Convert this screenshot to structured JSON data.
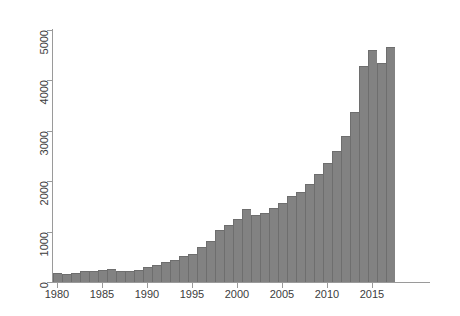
{
  "chart_data": {
    "type": "bar",
    "title": "",
    "subtitle": "",
    "xlabel": "",
    "ylabel": "",
    "xlim": [
      1979.5,
      2017.5
    ],
    "ylim": [
      0,
      5200
    ],
    "grid": false,
    "legend": null,
    "bar_color": "#828282",
    "bar_edge_color": "#6e6e6e",
    "axis_color": "#9a9a9a",
    "text_color": "#3c3c3c",
    "background": "#ffffff",
    "y_ticks": [
      0,
      1000,
      2000,
      3000,
      4000,
      5000
    ],
    "y_tick_labels": [
      "0",
      "1000",
      "2000",
      "3000",
      "4000",
      "5000"
    ],
    "x_ticks": [
      1980,
      1985,
      1990,
      1995,
      2000,
      2005,
      2010,
      2015
    ],
    "x_tick_labels": [
      "1980",
      "1985",
      "1990",
      "1995",
      "2000",
      "2005",
      "2010",
      "2015"
    ],
    "categories": [
      "1980",
      "1981",
      "1982",
      "1983",
      "1984",
      "1985",
      "1986",
      "1987",
      "1988",
      "1989",
      "1990",
      "1991",
      "1992",
      "1993",
      "1994",
      "1995",
      "1996",
      "1997",
      "1998",
      "1999",
      "2000",
      "2001",
      "2002",
      "2003",
      "2004",
      "2005",
      "2006",
      "2007",
      "2008",
      "2009",
      "2010",
      "2011",
      "2012",
      "2013",
      "2014",
      "2015",
      "2016",
      "2017"
    ],
    "values": [
      170,
      160,
      180,
      215,
      225,
      245,
      250,
      215,
      225,
      235,
      300,
      345,
      400,
      440,
      520,
      560,
      700,
      810,
      1030,
      1140,
      1250,
      1440,
      1330,
      1370,
      1470,
      1560,
      1710,
      1790,
      1940,
      2140,
      2360,
      2600,
      2900,
      3380,
      4280,
      4600,
      4350,
      4660
    ],
    "notes": {
      "shape": "exponential growth from ~170 in 1980 to ~4700 in 2017",
      "last_bars_pattern": "peak 2015, dip 2016, peak 2017"
    }
  },
  "axis": {
    "y_title": "",
    "x_title": ""
  }
}
